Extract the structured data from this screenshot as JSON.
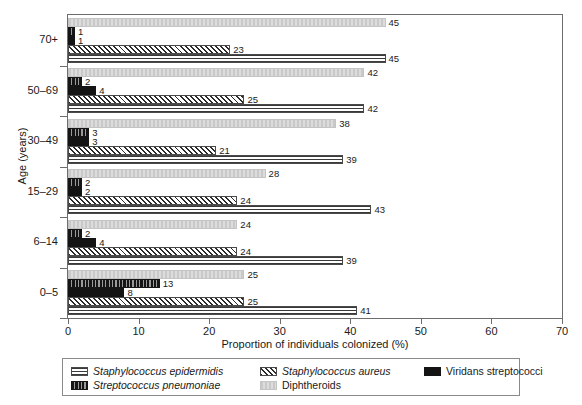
{
  "chart_data": {
    "type": "bar",
    "orientation": "horizontal",
    "title": "",
    "xlabel": "Proportion of individuals colonized (%)",
    "ylabel": "Age (years)",
    "xlim": [
      0,
      70
    ],
    "xticks": [
      0,
      10,
      20,
      30,
      40,
      50,
      60,
      70
    ],
    "grid": false,
    "legend_position": "bottom",
    "categories": [
      "0–5",
      "6–14",
      "15–29",
      "30–49",
      "50–69",
      "70+"
    ],
    "series": [
      {
        "name": "Staphylococcus epidermidis",
        "pattern": "horizontal-lines",
        "italic": true,
        "values": [
          41,
          39,
          43,
          39,
          42,
          45
        ]
      },
      {
        "name": "Staphylococcus aureus",
        "pattern": "diagonal-hatch",
        "italic": true,
        "values": [
          25,
          24,
          24,
          21,
          25,
          23
        ]
      },
      {
        "name": "Viridans streptococci",
        "pattern": "solid-black",
        "italic": false,
        "values": [
          8,
          4,
          2,
          3,
          4,
          1
        ]
      },
      {
        "name": "Streptococcus pneumoniae",
        "pattern": "vertical-ticks",
        "italic": true,
        "values": [
          13,
          2,
          2,
          3,
          2,
          1
        ]
      },
      {
        "name": "Diphtheroids",
        "pattern": "light-grey",
        "italic": false,
        "values": [
          25,
          24,
          28,
          38,
          42,
          45
        ]
      }
    ],
    "bar_order_top_to_bottom": [
      "Diphtheroids",
      "Streptococcus pneumoniae",
      "Viridans streptococci",
      "Staphylococcus aureus",
      "Staphylococcus epidermidis"
    ]
  },
  "legend": {
    "items": [
      {
        "label": "Staphylococcus epidermidis",
        "pattern": "horizontal-lines",
        "italic": true
      },
      {
        "label": "Staphylococcus aureus",
        "pattern": "diagonal-hatch",
        "italic": true
      },
      {
        "label": "Viridans streptococci",
        "pattern": "solid-black",
        "italic": false
      },
      {
        "label": "Streptococcus pneumoniae",
        "pattern": "vertical-ticks",
        "italic": true
      },
      {
        "label": "Diphtheroids",
        "pattern": "light-grey",
        "italic": false
      }
    ]
  },
  "colors": {
    "axis": "#6d6d6d",
    "text": "#1a1a1a",
    "black_series": "#141414",
    "grey_series": "#c9c9c9",
    "background": "#ffffff"
  }
}
